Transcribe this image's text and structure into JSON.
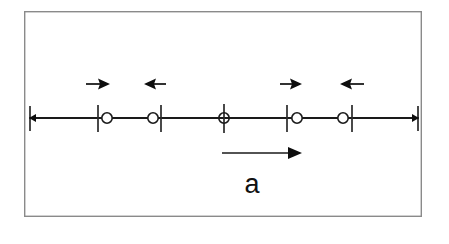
{
  "figure": {
    "name": "one-dimensional-atom-chain-displacement-diagram",
    "background_color": "#ffffff",
    "frame": {
      "name": "figure-border",
      "x": 24,
      "y": 11,
      "width": 398,
      "height": 206,
      "stroke_color": "#8a8a8a"
    },
    "axis": {
      "name": "chain-axis-line",
      "y": 118,
      "x_start": 29,
      "x_end": 419,
      "stroke_color": "#1a1a1a"
    },
    "end_caps": [
      {
        "name": "left-end-cap",
        "x": 29,
        "direction": "left"
      },
      {
        "name": "right-end-cap",
        "x": 419,
        "direction": "right"
      }
    ],
    "equilibrium_ticks": [
      {
        "name": "tick-1",
        "x": 98
      },
      {
        "name": "tick-2",
        "x": 161
      },
      {
        "name": "tick-3",
        "x": 224
      },
      {
        "name": "tick-4",
        "x": 287
      },
      {
        "name": "tick-5",
        "x": 352
      }
    ],
    "tick_top_y": 105,
    "tick_bottom_y": 132,
    "atoms": [
      {
        "name": "atom-1",
        "cx": 107,
        "cy": 118,
        "r": 5.2,
        "offset": "right"
      },
      {
        "name": "atom-2",
        "cx": 153,
        "cy": 118,
        "r": 5.2,
        "offset": "left"
      },
      {
        "name": "atom-3",
        "cx": 224,
        "cy": 118,
        "r": 5.2,
        "offset": "none"
      },
      {
        "name": "atom-4",
        "cx": 297,
        "cy": 118,
        "r": 5.2,
        "offset": "right"
      },
      {
        "name": "atom-5",
        "cx": 343,
        "cy": 118,
        "r": 5.2,
        "offset": "left"
      }
    ],
    "displacement_arrows": [
      {
        "name": "displacement-arrow-1",
        "direction": "right",
        "y": 84,
        "x_start": 86,
        "x_end": 109
      },
      {
        "name": "displacement-arrow-2",
        "direction": "left",
        "y": 84,
        "x_start": 166,
        "x_end": 145
      },
      {
        "name": "displacement-arrow-3",
        "direction": "right",
        "y": 84,
        "x_start": 280,
        "x_end": 301
      },
      {
        "name": "displacement-arrow-4",
        "direction": "left",
        "y": 84,
        "x_start": 364,
        "x_end": 341
      }
    ],
    "lattice_vector": {
      "name": "lattice-constant-arrow",
      "y": 153,
      "x_start": 222,
      "x_end": 301,
      "direction": "right",
      "label": "a",
      "label_x": 252,
      "label_y": 193
    }
  }
}
